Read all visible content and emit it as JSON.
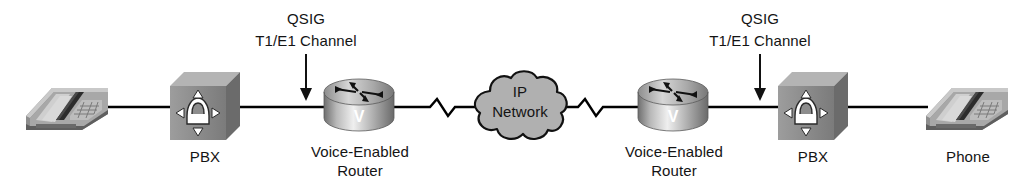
{
  "diagram": {
    "background_color": "#ffffff",
    "line_color": "#000000",
    "text_color": "#141414",
    "device_gray_light": "#d8d8d8",
    "device_gray_mid": "#9a9a9a",
    "device_gray_dark": "#6e6e6e",
    "cloud_fill": "#b0b0b0"
  },
  "nodes": {
    "left_phone": {
      "icon": "desk-phone-icon",
      "label": ""
    },
    "left_pbx": {
      "icon": "pbx-icon",
      "label": "PBX"
    },
    "left_router": {
      "icon": "voice-router-icon",
      "face_letter": "V",
      "label_line1": "Voice-Enabled",
      "label_line2": "Router"
    },
    "ip_cloud": {
      "icon": "cloud-icon",
      "label_line1": "IP",
      "label_line2": "Network"
    },
    "right_router": {
      "icon": "voice-router-icon",
      "face_letter": "V",
      "label_line1": "Voice-Enabled",
      "label_line2": "Router"
    },
    "right_pbx": {
      "icon": "pbx-icon",
      "label": "PBX"
    },
    "right_phone": {
      "icon": "desk-phone-icon",
      "label": "Phone"
    }
  },
  "annotations": {
    "left_qsig": {
      "line1": "QSIG",
      "line2": "T1/E1 Channel",
      "pointer": "down-arrow-icon"
    },
    "right_qsig": {
      "line1": "QSIG",
      "line2": "T1/E1 Channel",
      "pointer": "down-arrow-icon"
    }
  },
  "links": {
    "phone_to_pbx_left": "straight-line",
    "pbx_to_router_left": "straight-line",
    "router_to_cloud_left": "zigzag-line",
    "cloud_to_router_right": "zigzag-line",
    "router_to_pbx_right": "straight-line",
    "pbx_to_phone_right": "straight-line"
  }
}
